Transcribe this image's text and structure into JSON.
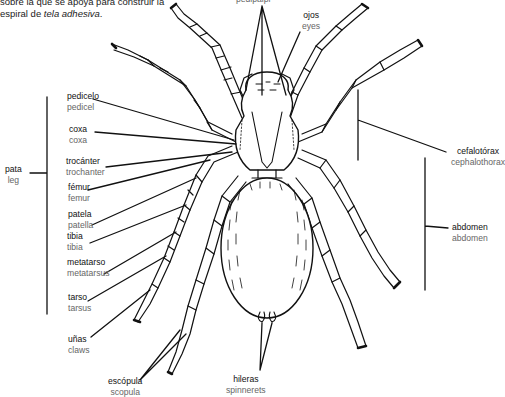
{
  "intro": {
    "line1": "sobre la que se apoya para construir la",
    "line2_prefix": "espiral de ",
    "line2_em": "tela adhesiva",
    "line2_suffix": "."
  },
  "labels": {
    "pedipalpi": {
      "es": "",
      "en": "pedipalpi"
    },
    "ojos": {
      "es": "ojos",
      "en": "eyes"
    },
    "pedicelo": {
      "es": "pedicelo",
      "en": "pedicel"
    },
    "coxa": {
      "es": "coxa",
      "en": "coxa"
    },
    "trocanter": {
      "es": "trocánter",
      "en": "trochanter"
    },
    "pata": {
      "es": "pata",
      "en": "leg"
    },
    "femur": {
      "es": "fémur",
      "en": "femur"
    },
    "patela": {
      "es": "patela",
      "en": "patella"
    },
    "tibia": {
      "es": "tibia",
      "en": "tibia"
    },
    "metatarso": {
      "es": "metatarso",
      "en": "metatarsus"
    },
    "tarso": {
      "es": "tarso",
      "en": "tarsus"
    },
    "unas": {
      "es": "uñas",
      "en": "claws"
    },
    "escopula": {
      "es": "escópula",
      "en": "scopula"
    },
    "hileras": {
      "es": "hileras",
      "en": "spinnerets"
    },
    "cefalotorax": {
      "es": "cefalotórax",
      "en": "cephalothorax"
    },
    "abdomen": {
      "es": "abdomen",
      "en": "abdomen"
    }
  }
}
